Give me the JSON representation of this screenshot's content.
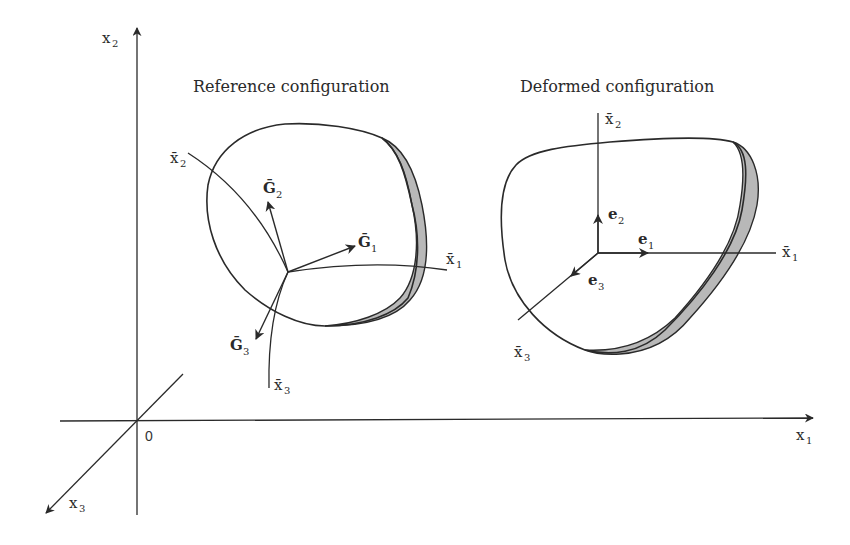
{
  "diagram": {
    "global_axes": {
      "x1": {
        "base": "x",
        "sub": "1"
      },
      "x2": {
        "base": "x",
        "sub": "2"
      },
      "x3": {
        "base": "x",
        "sub": "3"
      },
      "origin": "0"
    },
    "reference": {
      "title": "Reference configuration",
      "curvilinear_axes": [
        {
          "base": "x̄",
          "sub": "1"
        },
        {
          "base": "x̄",
          "sub": "2"
        },
        {
          "base": "x̄",
          "sub": "3"
        }
      ],
      "base_vectors": [
        {
          "base": "Ḡ",
          "sub": "1"
        },
        {
          "base": "Ḡ",
          "sub": "2"
        },
        {
          "base": "Ḡ",
          "sub": "3"
        }
      ]
    },
    "deformed": {
      "title": "Deformed configuration",
      "axes": [
        {
          "base": "x̄",
          "sub": "1"
        },
        {
          "base": "x̄",
          "sub": "2"
        },
        {
          "base": "x̄",
          "sub": "3"
        }
      ],
      "unit_vectors": [
        {
          "base": "e",
          "sub": "1"
        },
        {
          "base": "e",
          "sub": "2"
        },
        {
          "base": "e",
          "sub": "3"
        }
      ]
    },
    "colors": {
      "line": "#2a2a2a",
      "shading": "#b8b8b8",
      "background": "#ffffff"
    }
  }
}
